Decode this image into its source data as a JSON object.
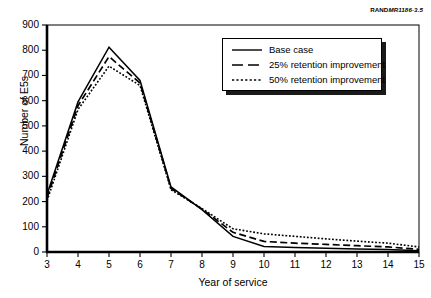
{
  "figure": {
    "source_credit_bold": "RAND",
    "source_credit_italic": "MR1186-3.5"
  },
  "chart_data": {
    "type": "line",
    "title": "",
    "xlabel": "Year of service",
    "ylabel": "Number of E5s",
    "x": [
      3,
      4,
      5,
      6,
      7,
      8,
      9,
      10,
      11,
      12,
      13,
      14,
      15
    ],
    "xlim": [
      3,
      15
    ],
    "ylim": [
      0,
      900
    ],
    "xticks": [
      3,
      4,
      5,
      6,
      7,
      8,
      9,
      10,
      11,
      12,
      13,
      14,
      15
    ],
    "yticks": [
      0,
      100,
      200,
      300,
      400,
      500,
      600,
      700,
      800,
      900
    ],
    "grid": false,
    "legend_position": "upper right",
    "series": [
      {
        "name": "Base case",
        "style": "solid",
        "values": [
          228,
          595,
          812,
          680,
          258,
          168,
          62,
          22,
          18,
          15,
          12,
          10,
          5
        ]
      },
      {
        "name": "25% retention improvement",
        "style": "dashed",
        "values": [
          215,
          580,
          775,
          670,
          252,
          170,
          78,
          42,
          35,
          30,
          25,
          20,
          11
        ]
      },
      {
        "name": "50% retention improvement",
        "style": "dotted",
        "values": [
          203,
          565,
          737,
          660,
          247,
          172,
          92,
          72,
          62,
          52,
          43,
          35,
          20
        ]
      }
    ]
  },
  "legend": {
    "items": [
      {
        "label": "Base case",
        "style": "solid"
      },
      {
        "label": "25% retention improvement",
        "style": "dashed"
      },
      {
        "label": "50% retention improvement",
        "style": "dotted"
      }
    ]
  },
  "colors": {
    "line": "#000000",
    "axis": "#000000",
    "background": "#ffffff",
    "legend_shadow": "#1a1a1a"
  }
}
